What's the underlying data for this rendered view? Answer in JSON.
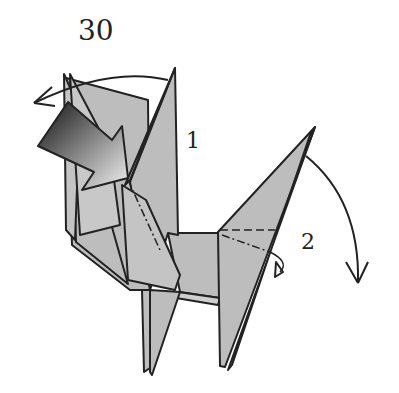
{
  "diagram": {
    "step_number": "30",
    "labels": [
      {
        "id": "1",
        "text": "1",
        "description": "fold neck/head backward (reverse fold)"
      },
      {
        "id": "2",
        "text": "2",
        "description": "fold tail downward (reverse fold)"
      }
    ],
    "colors": {
      "paper": "#bdbdbd",
      "paper_light": "#d0d0d0",
      "outline": "#222222",
      "arrow_dark": "#1a1a1a",
      "arrow_light": "#e8e8e8",
      "background": "#ffffff"
    }
  }
}
